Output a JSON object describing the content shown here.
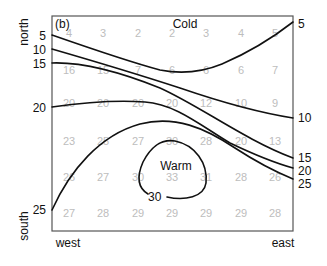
{
  "panel_label": "(b)",
  "region_labels": {
    "cold": "Cold",
    "warm": "Warm"
  },
  "axes": {
    "north": "north",
    "south": "south",
    "west": "west",
    "east": "east"
  },
  "contour_labels": {
    "left": [
      {
        "value": "5",
        "y": 36
      },
      {
        "value": "10",
        "y": 50
      },
      {
        "value": "15",
        "y": 64
      },
      {
        "value": "20",
        "y": 108
      },
      {
        "value": "25",
        "y": 211
      }
    ],
    "right": [
      {
        "value": "5",
        "y": 23
      },
      {
        "value": "10",
        "y": 119
      },
      {
        "value": "15",
        "y": 159
      },
      {
        "value": "20",
        "y": 172
      },
      {
        "value": "25",
        "y": 185
      }
    ],
    "inner": {
      "value": "30"
    }
  },
  "grid": {
    "columns_x": [
      69,
      103,
      138,
      172,
      206,
      241,
      275
    ],
    "rows_y": [
      37,
      74,
      107,
      145,
      181,
      217
    ],
    "values": [
      [
        4,
        3,
        2,
        2,
        3,
        4,
        5
      ],
      [
        16,
        15,
        7,
        6,
        6,
        6,
        7
      ],
      [
        20,
        20,
        20,
        20,
        12,
        10,
        9
      ],
      [
        23,
        25,
        27,
        30,
        28,
        20,
        13
      ],
      [
        26,
        27,
        30,
        33,
        31,
        28,
        26
      ],
      [
        27,
        28,
        29,
        29,
        29,
        29,
        28
      ]
    ]
  },
  "colors": {
    "contour": "#111111",
    "grid_values": "#bdbdbd",
    "frame": "#555555"
  }
}
